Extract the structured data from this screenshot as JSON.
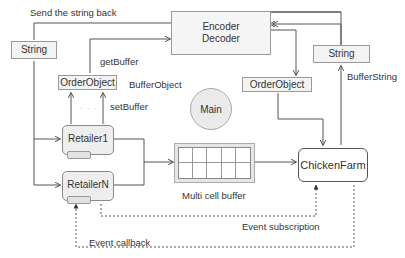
{
  "diagram": {
    "nodes": {
      "encoder": {
        "line1": "Encoder",
        "line2": "Decoder"
      },
      "string_left": {
        "label": "String"
      },
      "string_right": {
        "label": "String"
      },
      "order_object_left": {
        "label": "OrderObject"
      },
      "order_object_right": {
        "label": "OrderObject"
      },
      "main": {
        "label": "Main"
      },
      "retailer1": {
        "label": "Retailer1"
      },
      "retailerN": {
        "label": "RetailerN"
      },
      "buffer": {
        "label": "Multi cell buffer",
        "rows": 2,
        "cols": 5
      },
      "chicken_farm": {
        "label": "ChickenFarm"
      }
    },
    "edge_labels": {
      "send_back": "Send the string back",
      "get_buffer": "getBuffer",
      "buffer_object": "BufferObject",
      "set_buffer": "setBuffer",
      "buffer_string": "BufferString",
      "event_subscription": "Event subscription",
      "event_callback": "Event callback"
    },
    "ellipsis": {
      "dots_order": "· · ·",
      "dots_retailers": "· · ·"
    }
  }
}
